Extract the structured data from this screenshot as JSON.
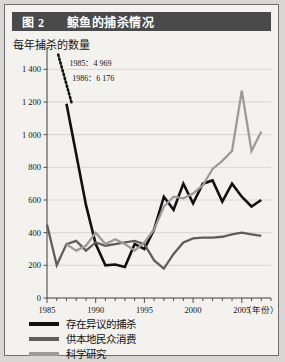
{
  "figure": {
    "number_label": "图 2",
    "title": "鲸鱼的捕杀情况"
  },
  "chart_data": {
    "type": "line",
    "title": "鲸鱼的捕杀情况",
    "ylabel": "每年捕杀的数量",
    "xlabel": "（年份）",
    "xlim": [
      1985,
      2008
    ],
    "ylim": [
      0,
      1500
    ],
    "yticks": [
      0,
      200,
      400,
      600,
      800,
      1000,
      1200,
      1400
    ],
    "ytick_labels": [
      "0",
      "200",
      "400",
      "600",
      "800",
      "1 000",
      "1 200",
      "1 400"
    ],
    "xticks": [
      1985,
      1990,
      1995,
      2000,
      2005
    ],
    "xtick_labels": [
      "1985",
      "1990",
      "1995",
      "2000",
      "2005"
    ],
    "minor_xticks_every": 1,
    "grid": "horizontal",
    "legend_position": "below-plot",
    "annotations": [
      {
        "text": "1985：4 969",
        "x": 1987.3,
        "y": 1420
      },
      {
        "text": "1986：6 176",
        "x": 1987.6,
        "y": 1330
      }
    ],
    "x": [
      1985,
      1986,
      1987,
      1988,
      1989,
      1990,
      1991,
      1992,
      1993,
      1994,
      1995,
      1996,
      1997,
      1998,
      1999,
      2000,
      2001,
      2002,
      2003,
      2004,
      2005,
      2006,
      2007
    ],
    "series": [
      {
        "name": "存在异议的捕杀",
        "color": "#111111",
        "width": 2.6,
        "note": "1985 and 1986 values (4 969 and 6 176) are off-scale; shown as a dotted descending stub",
        "offscale_years": [
          1985,
          1986
        ],
        "dotted_stub": {
          "from": [
            1986.15,
            1490
          ],
          "to": [
            1987.55,
            1190
          ]
        },
        "values": [
          4969,
          6176,
          1190,
          880,
          570,
          330,
          200,
          205,
          190,
          330,
          300,
          420,
          620,
          540,
          700,
          580,
          700,
          720,
          590,
          700,
          620,
          560,
          600
        ]
      },
      {
        "name": "供本地民众消费",
        "color": "#5e5e5e",
        "width": 2.3,
        "values": [
          450,
          200,
          330,
          350,
          290,
          340,
          320,
          330,
          340,
          350,
          330,
          230,
          180,
          270,
          340,
          365,
          370,
          370,
          375,
          390,
          400,
          390,
          380
        ]
      },
      {
        "name": "科学研究",
        "color": "#9b9b9b",
        "width": 2.3,
        "values": [
          null,
          null,
          330,
          290,
          320,
          400,
          330,
          360,
          330,
          290,
          340,
          420,
          560,
          620,
          610,
          640,
          690,
          790,
          840,
          900,
          1270,
          900,
          1020
        ]
      }
    ]
  },
  "legend": {
    "items": [
      {
        "label": "存在异议的捕杀",
        "color": "#111111"
      },
      {
        "label": "供本地民众消费",
        "color": "#5e5e5e"
      },
      {
        "label": "科学研究",
        "color": "#9b9b9b"
      }
    ]
  }
}
